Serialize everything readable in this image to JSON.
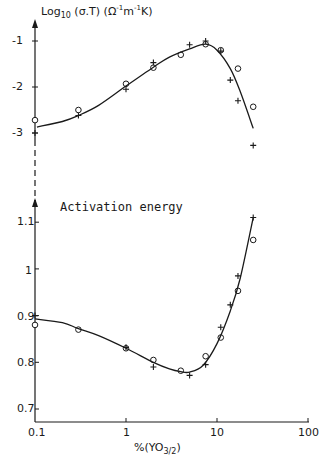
{
  "chart_data": [
    {
      "type": "scatter",
      "title": "",
      "ylabel": "Log10 (σ.T) (Ω⁻¹m⁻¹K)",
      "xlabel": "%(YO3/2)",
      "xscale": "log",
      "xlim": [
        0.1,
        100
      ],
      "ylim": [
        -3.3,
        -0.8
      ],
      "yticks": [
        -1,
        -2,
        -3
      ],
      "grid": false,
      "series": [
        {
          "name": "circles",
          "marker": "o",
          "x": [
            0.1,
            0.3,
            1,
            2,
            4,
            7.5,
            11,
            17,
            25
          ],
          "y": [
            -2.72,
            -2.5,
            -1.93,
            -1.58,
            -1.3,
            -1.07,
            -1.2,
            -1.6,
            -2.43
          ]
        },
        {
          "name": "crosses",
          "marker": "+",
          "x": [
            0.1,
            0.3,
            1,
            2,
            5,
            7.5,
            11,
            14,
            17,
            25
          ],
          "y": [
            -3.0,
            -2.62,
            -2.05,
            -1.47,
            -1.08,
            -1.0,
            -1.22,
            -1.85,
            -2.3,
            -3.27
          ]
        },
        {
          "name": "fit",
          "marker": "line",
          "x": [
            0.105,
            0.2,
            0.3,
            0.5,
            1,
            2,
            3,
            5,
            7.5,
            10,
            14,
            18,
            25
          ],
          "y": [
            -2.87,
            -2.75,
            -2.62,
            -2.4,
            -1.98,
            -1.57,
            -1.35,
            -1.17,
            -1.07,
            -1.2,
            -1.6,
            -2.1,
            -2.9
          ]
        }
      ]
    },
    {
      "type": "scatter",
      "title": "Activation energy",
      "ylabel": "",
      "xlabel": "%(YO3/2)",
      "xscale": "log",
      "xlim": [
        0.1,
        100
      ],
      "ylim": [
        0.67,
        1.12
      ],
      "yticks": [
        0.7,
        0.8,
        0.9,
        1,
        1.1
      ],
      "xticks": [
        0.1,
        1,
        10,
        100
      ],
      "grid": false,
      "series": [
        {
          "name": "circles",
          "marker": "o",
          "x": [
            0.1,
            0.3,
            1,
            2,
            4,
            7.5,
            11,
            17,
            25
          ],
          "y": [
            0.88,
            0.87,
            0.83,
            0.805,
            0.782,
            0.813,
            0.853,
            0.953,
            1.062
          ]
        },
        {
          "name": "crosses",
          "marker": "+",
          "x": [
            0.1,
            1,
            2,
            5,
            7.5,
            11,
            14,
            17,
            25
          ],
          "y": [
            0.9,
            0.832,
            0.79,
            0.772,
            0.795,
            0.875,
            0.923,
            0.985,
            1.11
          ]
        },
        {
          "name": "fit",
          "marker": "line",
          "x": [
            0.1,
            0.2,
            0.3,
            0.5,
            1,
            2,
            3,
            4,
            5,
            7,
            10,
            14,
            18,
            25
          ],
          "y": [
            0.893,
            0.885,
            0.872,
            0.857,
            0.83,
            0.8,
            0.786,
            0.78,
            0.779,
            0.793,
            0.84,
            0.91,
            0.98,
            1.11
          ]
        }
      ]
    }
  ],
  "labels": {
    "upper_ylabel_prefix": "Log",
    "upper_ylabel_sub": "10",
    "upper_ylabel_rest": " (σ.T) (Ω",
    "upper_ylabel_sup1": "-1",
    "upper_ylabel_m": "m",
    "upper_ylabel_sup2": "-1",
    "upper_ylabel_end": "K)",
    "lower_title": "Activation energy",
    "xlabel_main": "%(YO",
    "xlabel_sub": "3/2",
    "xlabel_end": ")",
    "upper_yticks": [
      "-1",
      "-2",
      "-3"
    ],
    "lower_yticks": [
      "1.1",
      "1",
      "0.9",
      "0.8",
      "0.7"
    ],
    "xticks": [
      "0.1",
      "1",
      "10",
      "100"
    ]
  }
}
